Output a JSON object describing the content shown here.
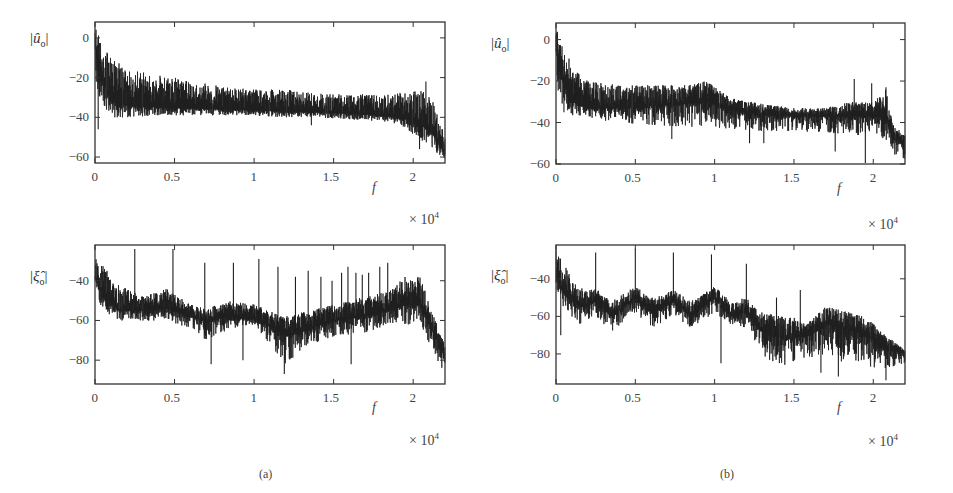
{
  "figure": {
    "panels": [
      {
        "id": "a",
        "caption": "(a)"
      },
      {
        "id": "b",
        "caption": "(b)"
      }
    ],
    "axis_multiplier": {
      "text": "× 10",
      "exp": "4"
    },
    "xvar": "f",
    "line_color": "#1e1e1e"
  },
  "chart_data": [
    {
      "panel": "a-top",
      "type": "line",
      "title": "",
      "ylabel": "|û_o|",
      "xlabel": "f",
      "x_multiplier": "× 10^4",
      "xlim": [
        0,
        2.2
      ],
      "ylim": [
        -63,
        8
      ],
      "xticks": [
        0,
        0.5,
        1,
        1.5,
        2
      ],
      "xtick_labels": [
        "0",
        "0.5",
        "1",
        "1.5",
        "2"
      ],
      "yticks": [
        0,
        -20,
        -40,
        -60
      ],
      "ytick_labels": [
        "0",
        "-20",
        "-40",
        "-60"
      ],
      "grid": false,
      "envelope": {
        "x": [
          0,
          0.03,
          0.1,
          0.2,
          0.4,
          0.6,
          0.8,
          1.0,
          1.2,
          1.4,
          1.6,
          1.8,
          1.95,
          2.05,
          2.12,
          2.2
        ],
        "base": [
          -5,
          -18,
          -32,
          -34,
          -35,
          -35.5,
          -36,
          -36.5,
          -37,
          -37.5,
          -38,
          -39,
          -41,
          -44,
          -48,
          -58
        ],
        "upper": [
          6,
          0,
          -10,
          -15,
          -18,
          -22,
          -24,
          -26,
          -26,
          -28,
          -28,
          -29,
          -27,
          -26,
          -30,
          -50
        ],
        "lower": [
          -20,
          -30,
          -40,
          -40,
          -39,
          -39,
          -39,
          -39,
          -40,
          -40,
          -41,
          -42,
          -45,
          -52,
          -55,
          -62
        ]
      },
      "spikes": [
        {
          "x": 0.02,
          "y": -46
        },
        {
          "x": 1.36,
          "y": -44
        },
        {
          "x": 2.04,
          "y": -56
        },
        {
          "x": 2.08,
          "y": -22
        },
        {
          "x": 2.15,
          "y": -58
        }
      ]
    },
    {
      "panel": "a-bottom",
      "type": "line",
      "title": "",
      "ylabel": "|ξ̂_o|",
      "xlabel": "f",
      "x_multiplier": "× 10^4",
      "xlim": [
        0,
        2.2
      ],
      "ylim": [
        -92,
        -22
      ],
      "xticks": [
        0,
        0.5,
        1,
        1.5,
        2
      ],
      "xtick_labels": [
        "0",
        "0.5",
        "1",
        "1.5",
        "2"
      ],
      "yticks": [
        -40,
        -60,
        -80
      ],
      "ytick_labels": [
        "-40",
        "-60",
        "-80"
      ],
      "grid": false,
      "envelope": {
        "x": [
          0,
          0.05,
          0.15,
          0.3,
          0.45,
          0.6,
          0.7,
          0.85,
          1.0,
          1.1,
          1.2,
          1.35,
          1.5,
          1.7,
          1.85,
          1.95,
          2.05,
          2.1,
          2.2
        ],
        "base": [
          -38,
          -48,
          -55,
          -55,
          -54,
          -58,
          -60,
          -58,
          -59,
          -63,
          -68,
          -64,
          -60,
          -58,
          -55,
          -52,
          -52,
          -62,
          -78
        ],
        "upper": [
          -25,
          -32,
          -42,
          -48,
          -44,
          -52,
          -54,
          -50,
          -52,
          -55,
          -58,
          -55,
          -52,
          -48,
          -45,
          -38,
          -38,
          -52,
          -72
        ],
        "lower": [
          -45,
          -55,
          -60,
          -60,
          -60,
          -64,
          -70,
          -64,
          -62,
          -72,
          -82,
          -72,
          -68,
          -66,
          -62,
          -62,
          -62,
          -72,
          -87
        ]
      },
      "spikes": [
        {
          "x": 0.25,
          "y": -24
        },
        {
          "x": 0.49,
          "y": -24
        },
        {
          "x": 0.69,
          "y": -31
        },
        {
          "x": 0.73,
          "y": -82
        },
        {
          "x": 0.87,
          "y": -31
        },
        {
          "x": 0.93,
          "y": -80
        },
        {
          "x": 1.03,
          "y": -29
        },
        {
          "x": 1.15,
          "y": -33
        },
        {
          "x": 1.19,
          "y": -87
        },
        {
          "x": 1.26,
          "y": -38
        },
        {
          "x": 1.34,
          "y": -35
        },
        {
          "x": 1.42,
          "y": -38
        },
        {
          "x": 1.49,
          "y": -40
        },
        {
          "x": 1.55,
          "y": -36
        },
        {
          "x": 1.59,
          "y": -33
        },
        {
          "x": 1.61,
          "y": -82
        },
        {
          "x": 1.64,
          "y": -36
        },
        {
          "x": 1.68,
          "y": -37
        },
        {
          "x": 1.72,
          "y": -36
        },
        {
          "x": 1.79,
          "y": -33
        },
        {
          "x": 1.84,
          "y": -31
        }
      ]
    },
    {
      "panel": "b-top",
      "type": "line",
      "title": "",
      "ylabel": "|û_o|",
      "xlabel": "f",
      "x_multiplier": "× 10^4",
      "xlim": [
        0,
        2.2
      ],
      "ylim": [
        -60,
        8
      ],
      "xticks": [
        0,
        0.5,
        1,
        1.5,
        2
      ],
      "xtick_labels": [
        "0",
        "0.5",
        "1",
        "1.5",
        "2"
      ],
      "yticks": [
        0,
        -20,
        -40,
        -60
      ],
      "ytick_labels": [
        "0",
        "-20",
        "-40",
        "-60"
      ],
      "grid": false,
      "envelope": {
        "x": [
          0,
          0.03,
          0.1,
          0.2,
          0.4,
          0.6,
          0.8,
          0.95,
          1.1,
          1.3,
          1.5,
          1.7,
          1.85,
          2.0,
          2.08,
          2.12,
          2.2
        ],
        "base": [
          -5,
          -18,
          -30,
          -33,
          -33,
          -32,
          -31,
          -30,
          -34,
          -36,
          -37,
          -37,
          -37,
          -37,
          -38,
          -46,
          -52
        ],
        "upper": [
          6,
          0,
          -12,
          -20,
          -22,
          -22,
          -22,
          -20,
          -28,
          -31,
          -33,
          -33,
          -30,
          -30,
          -24,
          -40,
          -45
        ],
        "lower": [
          -20,
          -30,
          -37,
          -38,
          -40,
          -41,
          -42,
          -42,
          -43,
          -44,
          -44,
          -45,
          -46,
          -46,
          -48,
          -55,
          -58
        ]
      },
      "spikes": [
        {
          "x": 0.05,
          "y": -35
        },
        {
          "x": 0.73,
          "y": -48
        },
        {
          "x": 1.22,
          "y": -50
        },
        {
          "x": 1.31,
          "y": -50
        },
        {
          "x": 1.76,
          "y": -54
        },
        {
          "x": 1.88,
          "y": -19
        },
        {
          "x": 1.95,
          "y": -60
        },
        {
          "x": 1.99,
          "y": -21
        },
        {
          "x": 2.08,
          "y": -23
        }
      ]
    },
    {
      "panel": "b-bottom",
      "type": "line",
      "title": "",
      "ylabel": "|ξ̂_o|",
      "xlabel": "f",
      "x_multiplier": "× 10^4",
      "xlim": [
        0,
        2.2
      ],
      "ylim": [
        -96,
        -22
      ],
      "xticks": [
        0,
        0.5,
        1,
        1.5,
        2
      ],
      "xtick_labels": [
        "0",
        "0.5",
        "1",
        "1.5",
        "2"
      ],
      "yticks": [
        -40,
        -60,
        -80
      ],
      "ytick_labels": [
        "-40",
        "-60",
        "-80"
      ],
      "grid": false,
      "envelope": {
        "x": [
          0,
          0.05,
          0.15,
          0.25,
          0.35,
          0.5,
          0.6,
          0.75,
          0.85,
          1.0,
          1.1,
          1.2,
          1.3,
          1.45,
          1.6,
          1.7,
          1.8,
          1.95,
          2.05,
          2.2
        ],
        "base": [
          -38,
          -48,
          -55,
          -52,
          -60,
          -50,
          -58,
          -52,
          -60,
          -50,
          -60,
          -58,
          -68,
          -72,
          -70,
          -64,
          -66,
          -70,
          -76,
          -80
        ],
        "upper": [
          -25,
          -32,
          -45,
          -45,
          -52,
          -44,
          -50,
          -46,
          -52,
          -44,
          -52,
          -50,
          -58,
          -60,
          -62,
          -55,
          -56,
          -60,
          -68,
          -78
        ],
        "lower": [
          -45,
          -56,
          -64,
          -60,
          -68,
          -58,
          -66,
          -60,
          -66,
          -58,
          -64,
          -66,
          -82,
          -86,
          -82,
          -80,
          -84,
          -86,
          -88,
          -85
        ]
      },
      "spikes": [
        {
          "x": 0.03,
          "y": -70
        },
        {
          "x": 0.25,
          "y": -26
        },
        {
          "x": 0.5,
          "y": -24
        },
        {
          "x": 0.74,
          "y": -26
        },
        {
          "x": 0.98,
          "y": -27
        },
        {
          "x": 1.04,
          "y": -85
        },
        {
          "x": 1.2,
          "y": -32
        },
        {
          "x": 1.39,
          "y": -50
        },
        {
          "x": 1.54,
          "y": -46
        },
        {
          "x": 1.67,
          "y": -90
        },
        {
          "x": 1.78,
          "y": -92
        },
        {
          "x": 2.08,
          "y": -94
        }
      ]
    }
  ]
}
